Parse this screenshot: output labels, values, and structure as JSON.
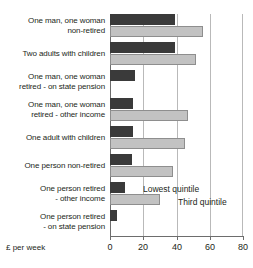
{
  "chart_data": {
    "type": "bar",
    "orientation": "horizontal",
    "title": "",
    "xlabel": "£ per week",
    "ylabel": "",
    "xlim": [
      0,
      80
    ],
    "xticks": [
      0,
      20,
      40,
      60,
      80
    ],
    "grid": true,
    "legend_position": "inside-right-middle",
    "categories": [
      "One man, one woman non-retired",
      "Two adults with children",
      "One man, one woman retired - on state pension",
      "One man, one woman retired - other income",
      "One adult with children",
      "One person non-retired",
      "One person retired - other income",
      "One person retired - on state pension"
    ],
    "category_lines": [
      [
        "One man, one woman",
        "non-retired"
      ],
      [
        "Two adults with children"
      ],
      [
        "One man, one woman",
        "retired - on state pension"
      ],
      [
        "One man, one woman",
        "retired - other income"
      ],
      [
        "One adult with children"
      ],
      [
        "One person non-retired"
      ],
      [
        "One person retired",
        "- other income"
      ],
      [
        "One person retired",
        "- on state pension"
      ]
    ],
    "series": [
      {
        "name": "Lowest quintile",
        "color": "#3a3a3a",
        "values": [
          39,
          39,
          15,
          14,
          14,
          13,
          9,
          4
        ]
      },
      {
        "name": "Third quintile",
        "color": "#c2c2c2",
        "values": [
          56,
          52,
          0,
          47,
          45,
          38,
          30,
          0
        ]
      }
    ]
  },
  "axis": {
    "caption": "£ per week",
    "tick_labels": [
      "0",
      "20",
      "40",
      "60",
      "80"
    ]
  },
  "legend": {
    "lowest_label": "Lowest quintile",
    "third_label": "Third quintile"
  }
}
